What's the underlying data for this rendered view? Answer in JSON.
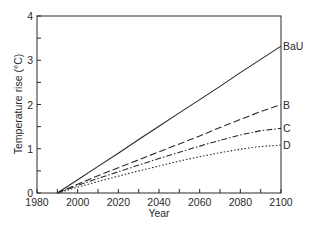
{
  "chart_data": {
    "type": "line",
    "title": "",
    "xlabel": "Year",
    "ylabel": "Temperature rise (°C)",
    "xlim": [
      1980,
      2100
    ],
    "ylim": [
      0,
      4
    ],
    "x_ticks": [
      "1980",
      "2000",
      "2020",
      "2040",
      "2060",
      "2080",
      "2100"
    ],
    "y_ticks": [
      "0",
      "1",
      "2",
      "3",
      "4"
    ],
    "grid": false,
    "legend_position": "inline-right",
    "x": [
      1990,
      2000,
      2010,
      2020,
      2030,
      2040,
      2050,
      2060,
      2070,
      2080,
      2090,
      2100
    ],
    "series": [
      {
        "name": "BaU",
        "style": "solid",
        "values": [
          0,
          0.3,
          0.6,
          0.9,
          1.21,
          1.51,
          1.81,
          2.11,
          2.41,
          2.72,
          3.02,
          3.32
        ]
      },
      {
        "name": "B",
        "style": "dashed",
        "values": [
          0,
          0.2,
          0.39,
          0.57,
          0.75,
          0.93,
          1.11,
          1.29,
          1.48,
          1.66,
          1.84,
          2.0
        ]
      },
      {
        "name": "C",
        "style": "dash-dot",
        "values": [
          0,
          0.17,
          0.33,
          0.48,
          0.63,
          0.78,
          0.92,
          1.06,
          1.19,
          1.31,
          1.41,
          1.46
        ]
      },
      {
        "name": "D",
        "style": "dotted",
        "values": [
          0,
          0.13,
          0.26,
          0.38,
          0.5,
          0.61,
          0.72,
          0.82,
          0.91,
          0.99,
          1.05,
          1.08
        ]
      }
    ]
  }
}
